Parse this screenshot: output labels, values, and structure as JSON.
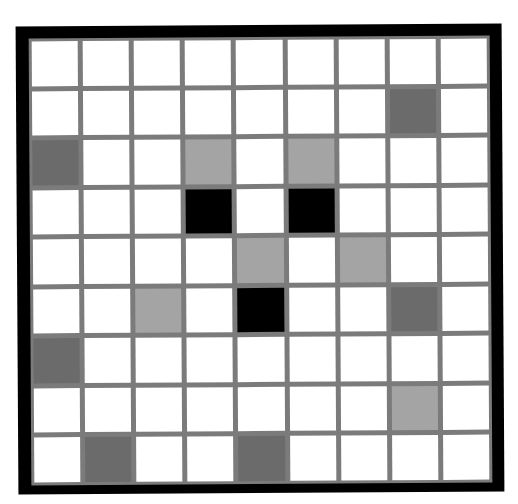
{
  "puzzle": {
    "rows": 9,
    "cols": 9,
    "colors": {
      "frame": "#000000",
      "gridline": "#7b7b7b",
      "white": "#ffffff",
      "light": "#a4a4a4",
      "dark": "#6b6b6b",
      "black": "#000000"
    },
    "grid": [
      [
        "white",
        "white",
        "white",
        "white",
        "white",
        "white",
        "white",
        "white",
        "white"
      ],
      [
        "white",
        "white",
        "white",
        "white",
        "white",
        "white",
        "white",
        "dark",
        "white"
      ],
      [
        "dark",
        "white",
        "white",
        "light",
        "white",
        "light",
        "white",
        "white",
        "white"
      ],
      [
        "white",
        "white",
        "white",
        "black",
        "white",
        "black",
        "white",
        "white",
        "white"
      ],
      [
        "white",
        "white",
        "white",
        "white",
        "light",
        "white",
        "light",
        "white",
        "white"
      ],
      [
        "white",
        "white",
        "light",
        "white",
        "black",
        "white",
        "white",
        "dark",
        "white"
      ],
      [
        "dark",
        "white",
        "white",
        "white",
        "white",
        "white",
        "white",
        "white",
        "white"
      ],
      [
        "white",
        "white",
        "white",
        "white",
        "white",
        "white",
        "white",
        "light",
        "white"
      ],
      [
        "white",
        "dark",
        "white",
        "white",
        "dark",
        "white",
        "white",
        "white",
        "white"
      ]
    ]
  }
}
